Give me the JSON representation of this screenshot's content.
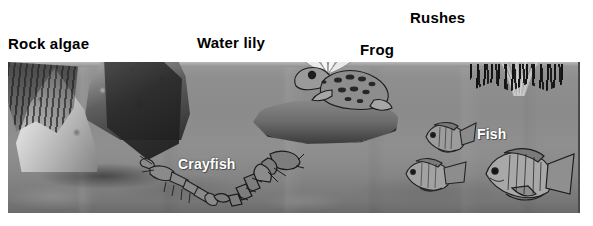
{
  "figure": {
    "kind": "pond-ecosystem-illustration",
    "rendering": "grayscale halftone diagram",
    "frame": {
      "x": 8,
      "y": 62,
      "width": 572,
      "height": 151
    }
  },
  "labels": [
    {
      "id": "rock-algae",
      "text": "Rock algae",
      "style": "dark",
      "x": 8,
      "y": 36
    },
    {
      "id": "water-lily",
      "text": "Water lily",
      "style": "dark",
      "x": 197,
      "y": 35
    },
    {
      "id": "frog",
      "text": "Frog",
      "style": "dark",
      "x": 360,
      "y": 42
    },
    {
      "id": "rushes",
      "text": "Rushes",
      "style": "dark",
      "x": 410,
      "y": 10
    },
    {
      "id": "crayfish",
      "text": "Crayfish",
      "style": "light",
      "x": 178,
      "y": 157
    },
    {
      "id": "fish",
      "text": "Fish",
      "style": "light",
      "x": 477,
      "y": 127
    }
  ],
  "label_text": {
    "rock_algae": "Rock algae",
    "water_lily": "Water lily",
    "frog": "Frog",
    "rushes": "Rushes",
    "crayfish": "Crayfish",
    "fish": "Fish"
  },
  "organisms": [
    {
      "name": "Rock algae",
      "count": 1,
      "zone": "rock surface, partly above waterline"
    },
    {
      "name": "Water lily",
      "count": 1,
      "zone": "surface, floating pad with flower"
    },
    {
      "name": "Frog",
      "count": 1,
      "zone": "on lily pad at surface"
    },
    {
      "name": "Rushes",
      "count": 1,
      "zone": "emergent, rooted in shallow bottom at right"
    },
    {
      "name": "Crayfish",
      "count": 2,
      "zone": "pond bottom, left of centre"
    },
    {
      "name": "Fish",
      "count": 3,
      "zone": "open water, right side"
    }
  ],
  "colors": {
    "page_background": "#ffffff",
    "water": "#8e8e8e",
    "water_surface": "#b9b9b9",
    "bottom_sediment": "#767676",
    "rock_light": "#d9d9d9",
    "rock_dark": "#2b2b2b",
    "label_dark": "#000000",
    "label_light": "#ffffff",
    "frame_edge": "#4a4a4a"
  }
}
